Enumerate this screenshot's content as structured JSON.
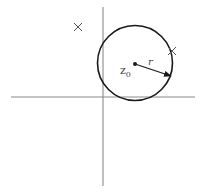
{
  "diagram": {
    "title": "",
    "center_label": "z",
    "center_subscript": "0",
    "radius_label": "r",
    "markers": [
      {
        "type": "cross",
        "x": 78,
        "y": 27
      },
      {
        "type": "cross",
        "x": 172,
        "y": 51
      }
    ],
    "colors": {
      "axis": "#8a8a8a",
      "circle": "#1a1a1a",
      "arrow": "#1a1a1a",
      "cross": "#555555"
    }
  }
}
